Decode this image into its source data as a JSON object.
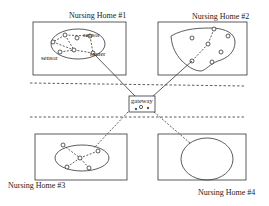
{
  "diagram": {
    "type": "network-topology",
    "homes": [
      {
        "id": "nh1",
        "label": "Nursing Home #1",
        "topology": "mesh-ellipse",
        "node_labels": [
          "sensor",
          "sensor",
          "router"
        ]
      },
      {
        "id": "nh2",
        "label": "Nursing Home #2",
        "topology": "irregular-region"
      },
      {
        "id": "nh3",
        "label": "Nursing Home #3",
        "topology": "star-ellipse"
      },
      {
        "id": "nh4",
        "label": "Nursing Home #4",
        "topology": "empty-ellipse"
      }
    ],
    "gateway": {
      "label": "gateway"
    },
    "colors": {
      "line": "#333333",
      "background": "#ffffff"
    }
  }
}
